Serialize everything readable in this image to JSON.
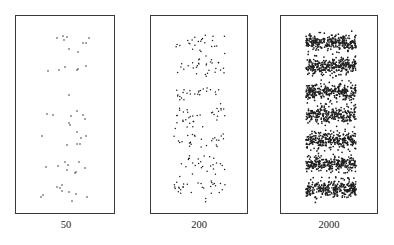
{
  "chart_data": {
    "type": "scatter",
    "title": "",
    "panels": [
      {
        "label": "50",
        "n_points": 50,
        "frame": {
          "x": 15,
          "y": 15,
          "w": 100,
          "h": 199
        },
        "points": [
          [
            56,
            37
          ],
          [
            62,
            35
          ],
          [
            66,
            36
          ],
          [
            63,
            39
          ],
          [
            88,
            37
          ],
          [
            82,
            42
          ],
          [
            85,
            42
          ],
          [
            68,
            48
          ],
          [
            77,
            51
          ],
          [
            47,
            70
          ],
          [
            58,
            69
          ],
          [
            64,
            66
          ],
          [
            76,
            69
          ],
          [
            77,
            68
          ],
          [
            85,
            65
          ],
          [
            68,
            94
          ],
          [
            46,
            113
          ],
          [
            52,
            114
          ],
          [
            70,
            115
          ],
          [
            76,
            110
          ],
          [
            82,
            114
          ],
          [
            84,
            118
          ],
          [
            68,
            122
          ],
          [
            69,
            124
          ],
          [
            76,
            131
          ],
          [
            41,
            135
          ],
          [
            80,
            137
          ],
          [
            85,
            135
          ],
          [
            66,
            144
          ],
          [
            76,
            143
          ],
          [
            79,
            143
          ],
          [
            64,
            161
          ],
          [
            78,
            161
          ],
          [
            67,
            164
          ],
          [
            45,
            166
          ],
          [
            57,
            165
          ],
          [
            66,
            169
          ],
          [
            84,
            167
          ],
          [
            74,
            172
          ],
          [
            75,
            171
          ],
          [
            61,
            184
          ],
          [
            56,
            186
          ],
          [
            59,
            187
          ],
          [
            61,
            190
          ],
          [
            68,
            191
          ],
          [
            75,
            193
          ],
          [
            86,
            196
          ],
          [
            42,
            194
          ],
          [
            40,
            196
          ],
          [
            71,
            200
          ]
        ]
      },
      {
        "label": "200",
        "n_points": 200,
        "frame": {
          "x": 150,
          "y": 15,
          "w": 98,
          "h": 199
        },
        "x_range": [
          173,
          224
        ],
        "band_centers_y": [
          42,
          65,
          91,
          114,
          139,
          163,
          188
        ],
        "band_half_height": 9,
        "seed": 7
      },
      {
        "label": "2000",
        "n_points": 2000,
        "frame": {
          "x": 280,
          "y": 15,
          "w": 98,
          "h": 199
        },
        "x_range": [
          305,
          355
        ],
        "band_centers_y": [
          42,
          65,
          91,
          114,
          139,
          163,
          188
        ],
        "band_half_height": 8,
        "seed": 11
      }
    ],
    "xlabel": "",
    "ylabel": "",
    "grid": false,
    "legend": null
  },
  "colors": {
    "frame": "#3a3a3a",
    "point": "#1e1e1e",
    "label": "#222222"
  }
}
